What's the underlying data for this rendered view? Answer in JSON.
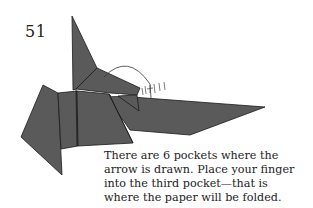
{
  "step": {
    "number": "51"
  },
  "caption": {
    "lines": [
      "There are 6 pockets where the",
      "arrow is drawn. Place your finger",
      "into the third pocket—that is",
      "where the paper will be folded."
    ]
  },
  "diagram": {
    "paper_color": "#5a5a5a",
    "line_color": "#1a1a1a",
    "arrow_color": "#333333",
    "pocket_count": 6,
    "target_pocket": 3
  }
}
